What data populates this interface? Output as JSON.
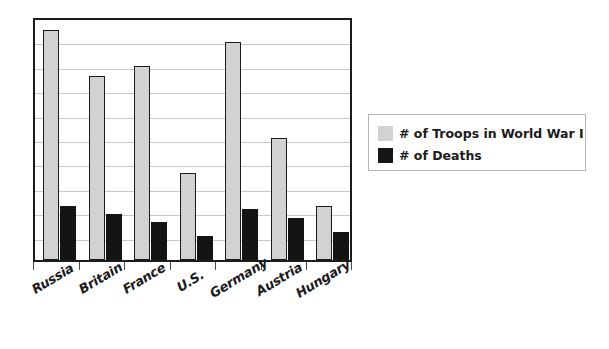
{
  "chart_data": {
    "type": "bar",
    "title": "",
    "subtitle": "",
    "xlabel": "",
    "ylabel": "",
    "grid": true,
    "legend_position": "right",
    "ylim": [
      0,
      18
    ],
    "y_gridline_count": 9,
    "categories": [
      "Russia",
      "Britain",
      "France",
      "U.S.",
      "Germany",
      "Austria",
      "Hungary"
    ],
    "series": [
      {
        "name": "# of Troops in World War I",
        "color": "#d2d2d2",
        "values": [
          17.0,
          13.6,
          14.3,
          6.4,
          16.1,
          9.0,
          4.0
        ]
      },
      {
        "name": "# of Deaths",
        "color": "#141414",
        "values": [
          4.0,
          3.4,
          2.8,
          1.8,
          3.8,
          3.1,
          2.1
        ]
      }
    ]
  },
  "axis": {
    "tick_labels": [
      "Russia",
      "Britain",
      "France",
      "U.S.",
      "Germany",
      "Austria",
      "Hungary"
    ]
  },
  "legend": {
    "entries": [
      {
        "label": "# of Troops in World War I",
        "swatch": "legend-swatch-troops"
      },
      {
        "label": "# of Deaths",
        "swatch": "legend-swatch-deaths"
      }
    ]
  },
  "colors": {
    "troops": "#d2d2d2",
    "deaths": "#141414",
    "frame": "#1b1b1b",
    "gridline": "#c9c9c9",
    "legend_border": "#b5b5b5",
    "background": "#ffffff"
  }
}
